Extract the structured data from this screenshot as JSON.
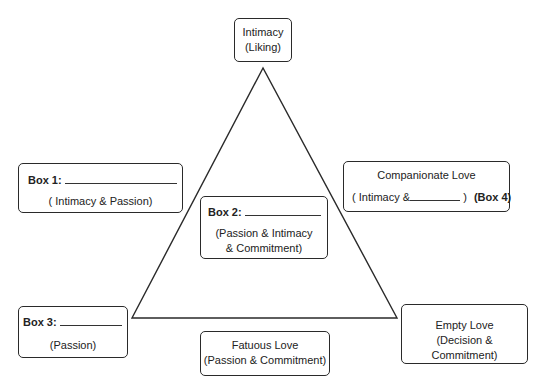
{
  "diagram": {
    "type": "triangle-of-love",
    "apex": {
      "line1": "Intimacy",
      "line2": "(Liking)"
    },
    "box1": {
      "label": "Box 1:",
      "subtitle": "( Intimacy & Passion)"
    },
    "box2": {
      "label": "Box 2:",
      "line1": "(Passion & Intimacy",
      "line2": "& Commitment)"
    },
    "box3": {
      "label": "Box 3:",
      "subtitle": "(Passion)"
    },
    "companionate": {
      "title": "Companionate Love",
      "prefix": "( Intimacy &",
      "suffix": ")",
      "tag": "(Box 4)"
    },
    "fatuous": {
      "title": "Fatuous Love",
      "subtitle": "(Passion & Commitment)"
    },
    "empty": {
      "title": "Empty Love",
      "subtitle": "(Decision & Commitment)"
    },
    "colors": {
      "stroke": "#2a2a2a",
      "background": "#ffffff"
    }
  }
}
